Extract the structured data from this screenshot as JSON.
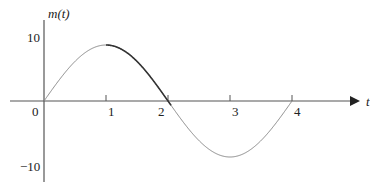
{
  "chart_data": {
    "type": "line",
    "title": "",
    "ylabel": "m(t)",
    "xlabel": "t",
    "x_ticks": [
      "1",
      "2",
      "3",
      "4"
    ],
    "y_ticks": [
      "10",
      "0",
      "−10"
    ],
    "origin_label": "0",
    "xlim": [
      0,
      4.3
    ],
    "ylim": [
      -10,
      10
    ],
    "grid": false,
    "series": [
      {
        "name": "m(t)",
        "function": "A·sin(πt/2), A ≈ 8.7",
        "x": [
          0,
          0.5,
          1,
          1.5,
          2,
          2.5,
          3,
          3.5,
          4
        ],
        "values": [
          0,
          6.2,
          8.7,
          6.2,
          0,
          -6.2,
          -8.7,
          -6.2,
          0
        ]
      }
    ]
  }
}
